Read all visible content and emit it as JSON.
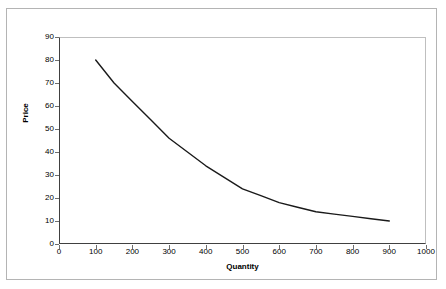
{
  "chart_data": {
    "type": "line",
    "title": "",
    "xlabel": "Quantity",
    "ylabel": "Price",
    "xlim": [
      0,
      1000
    ],
    "ylim": [
      0,
      90
    ],
    "grid": false,
    "legend": false,
    "x_ticks": [
      "0",
      "100",
      "200",
      "300",
      "400",
      "500",
      "600",
      "700",
      "800",
      "900",
      "1000"
    ],
    "x_tick_values": [
      0,
      100,
      200,
      300,
      400,
      500,
      600,
      700,
      800,
      900,
      1000
    ],
    "y_ticks": [
      "0",
      "10",
      "20",
      "30",
      "40",
      "50",
      "60",
      "70",
      "80",
      "90"
    ],
    "y_tick_values": [
      0,
      10,
      20,
      30,
      40,
      50,
      60,
      70,
      80,
      90
    ],
    "series": [
      {
        "name": "Demand",
        "color": "#1a1a1a",
        "x": [
          100,
          150,
          200,
          250,
          300,
          350,
          400,
          450,
          500,
          550,
          600,
          650,
          700,
          750,
          800,
          850,
          900
        ],
        "values": [
          80,
          70,
          62,
          54,
          46,
          40,
          34,
          29,
          24,
          21,
          18,
          16,
          14,
          13,
          12,
          11,
          10
        ]
      }
    ]
  },
  "chart": {
    "axis_color": "#404040",
    "plot_border_color": "#bfbfbf",
    "frame_color": "#b4b4b4",
    "curve_color": "#1a1a1a"
  }
}
